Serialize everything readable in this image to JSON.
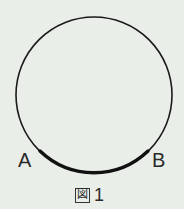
{
  "figure": {
    "caption_prefix": "図",
    "caption_number": "1",
    "points": [
      {
        "name": "A",
        "label": "A"
      },
      {
        "name": "B",
        "label": "B"
      }
    ],
    "circle": {
      "cx": 94,
      "cy": 95,
      "r": 78,
      "stroke": "#1a1a1a",
      "stroke_width": 1.6
    },
    "arc_AB": {
      "stroke": "#111111",
      "stroke_width": 3.4
    },
    "background": "#e9efe8"
  }
}
